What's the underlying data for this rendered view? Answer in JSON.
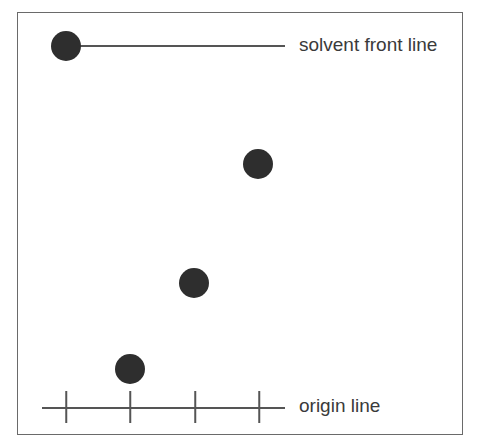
{
  "diagram": {
    "type": "thin layer chromatography plate",
    "labels": {
      "solvent_front": "solvent front line",
      "origin": "origin line"
    },
    "spots": [
      {
        "id": "solvent-front-spot",
        "x": 66,
        "y": 46
      },
      {
        "id": "spot-4",
        "x": 258,
        "y": 164
      },
      {
        "id": "spot-3",
        "x": 194,
        "y": 283
      },
      {
        "id": "spot-2",
        "x": 130,
        "y": 369
      }
    ],
    "origin_ticks_x": [
      66,
      130,
      195,
      259
    ],
    "colors": {
      "spot": "#2e2e2e",
      "line": "#555555",
      "text": "#3a3a3a"
    }
  }
}
